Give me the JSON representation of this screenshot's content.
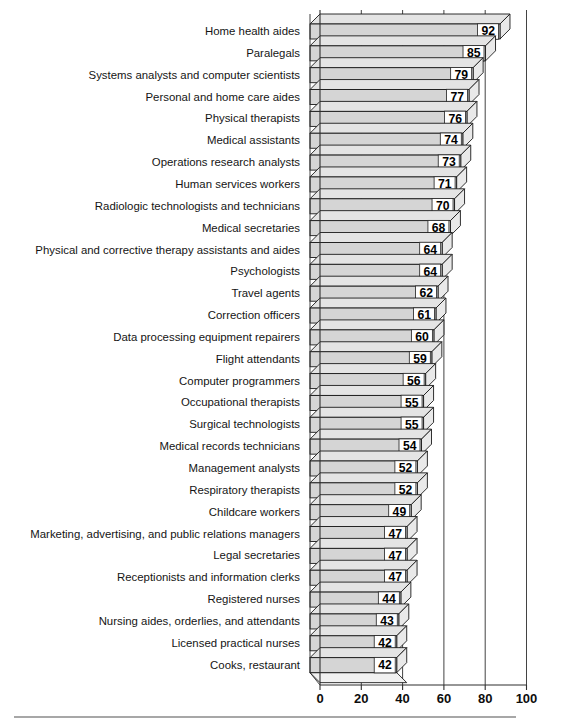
{
  "chart_data": {
    "type": "bar",
    "orientation": "horizontal",
    "title": "",
    "subtitle": "",
    "xlabel": "",
    "ylabel": "",
    "xlim": [
      0,
      100
    ],
    "xticks": [
      0,
      20,
      40,
      60,
      80,
      100
    ],
    "xtick_labels": [
      "0",
      "20",
      "40",
      "60",
      "80",
      "100"
    ],
    "grid": "vertical",
    "legend": "none",
    "style": "3d-shadow-bars",
    "bar_color": "#d5d5d5",
    "bar_edge_color": "#1a1a1a",
    "categories": [
      "Home health aides",
      "Paralegals",
      "Systems analysts and computer scientists",
      "Personal and home care aides",
      "Physical therapists",
      "Medical assistants",
      "Operations research analysts",
      "Human services workers",
      "Radiologic technologists and technicians",
      "Medical secretaries",
      "Physical and corrective therapy assistants and aides",
      "Psychologists",
      "Travel agents",
      "Correction officers",
      "Data processing equipment repairers",
      "Flight attendants",
      "Computer programmers",
      "Occupational therapists",
      "Surgical technologists",
      "Medical records technicians",
      "Management analysts",
      "Respiratory therapists",
      "Childcare workers",
      "Marketing, advertising, and public relations managers",
      "Legal secretaries",
      "Receptionists and information clerks",
      "Registered nurses",
      "Nursing aides, orderlies, and attendants",
      "Licensed practical nurses",
      "Cooks, restaurant"
    ],
    "values": [
      92,
      85,
      79,
      77,
      76,
      74,
      73,
      71,
      70,
      68,
      64,
      64,
      62,
      61,
      60,
      59,
      56,
      55,
      55,
      54,
      52,
      52,
      49,
      47,
      47,
      47,
      44,
      43,
      42,
      42
    ],
    "value_labels": [
      "92",
      "85",
      "79",
      "77",
      "76",
      "74",
      "73",
      "71",
      "70",
      "68",
      "64",
      "64",
      "62",
      "61",
      "60",
      "59",
      "56",
      "55",
      "55",
      "54",
      "52",
      "52",
      "49",
      "47",
      "47",
      "47",
      "44",
      "43",
      "42",
      "42"
    ]
  }
}
